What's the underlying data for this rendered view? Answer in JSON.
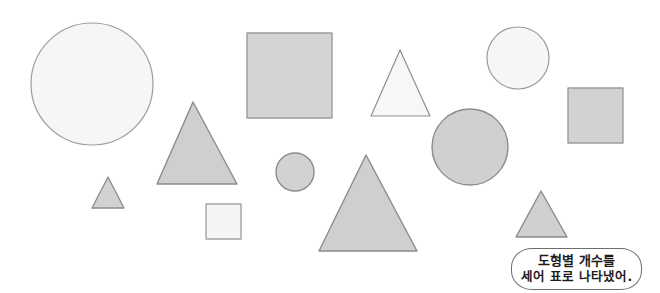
{
  "page": {
    "background_color": "#ffffff",
    "width": 660,
    "height": 293
  },
  "palette": {
    "shape_fill_gray": "#d2d2d2",
    "shape_fill_light": "#f2f2f2",
    "shape_stroke_gray": "#8c8c8c",
    "shape_stroke_light": "#9a9a9a",
    "bubble_border": "#6e6e6e",
    "bubble_background": "#ffffff",
    "bubble_text": "#1b1b1b"
  },
  "shapes": [
    {
      "id": "circle-large-white",
      "kind": "circle",
      "label": "큰 흰색 원",
      "cx": 92,
      "cy": 84,
      "r": 61,
      "fill": "#f6f6f6",
      "stroke": "#9a9a9a",
      "stroke_width": 1.2
    },
    {
      "id": "square-large-gray",
      "kind": "square",
      "label": "큰 회색 정사각형",
      "x": 247,
      "y": 33,
      "size": 85,
      "fill": "#d4d4d4",
      "stroke": "#9c9c9c",
      "stroke_width": 1.4
    },
    {
      "id": "triangle-top-white",
      "kind": "triangle",
      "label": "위쪽 흰색 삼각형",
      "apex_x": 400,
      "apex_y": 50,
      "base_left_x": 371,
      "base_right_x": 430,
      "base_y": 116,
      "fill": "#f7f7f7",
      "stroke": "#8f8f8f",
      "stroke_width": 1.2
    },
    {
      "id": "circle-topright-white",
      "kind": "circle",
      "label": "오른쪽 위 흰색 원",
      "cx": 518,
      "cy": 58,
      "r": 31,
      "fill": "#f6f6f6",
      "stroke": "#9a9a9a",
      "stroke_width": 1.2
    },
    {
      "id": "square-right-gray",
      "kind": "square",
      "label": "오른쪽 회색 정사각형",
      "x": 568,
      "y": 88,
      "size": 55,
      "fill": "#d2d2d2",
      "stroke": "#9c9c9c",
      "stroke_width": 1.4
    },
    {
      "id": "triangle-left-gray",
      "kind": "triangle",
      "label": "왼쪽 큰 회색 삼각형",
      "apex_x": 193,
      "apex_y": 102,
      "base_left_x": 157,
      "base_right_x": 237,
      "base_y": 184,
      "fill": "#cfcfcf",
      "stroke": "#8c8c8c",
      "stroke_width": 1.4
    },
    {
      "id": "circle-mid-gray",
      "kind": "circle",
      "label": "가운데 회색 큰 원",
      "cx": 470,
      "cy": 147,
      "r": 38,
      "fill": "#d0d0d0",
      "stroke": "#8c8c8c",
      "stroke_width": 1.4
    },
    {
      "id": "circle-small-gray",
      "kind": "circle",
      "label": "작은 회색 원",
      "cx": 295,
      "cy": 172,
      "r": 19,
      "fill": "#d2d2d2",
      "stroke": "#8c8c8c",
      "stroke_width": 1.4
    },
    {
      "id": "triangle-small-left-gray",
      "kind": "triangle",
      "label": "왼쪽 작은 회색 삼각형",
      "apex_x": 108,
      "apex_y": 177,
      "base_left_x": 92,
      "base_right_x": 124,
      "base_y": 208,
      "fill": "#d2d2d2",
      "stroke": "#8c8c8c",
      "stroke_width": 1.3
    },
    {
      "id": "triangle-center-gray",
      "kind": "triangle",
      "label": "가운데 큰 회색 삼각형",
      "apex_x": 366,
      "apex_y": 155,
      "base_left_x": 319,
      "base_right_x": 417,
      "base_y": 251,
      "fill": "#cfcfcf",
      "stroke": "#8c8c8c",
      "stroke_width": 1.4
    },
    {
      "id": "triangle-small-right-gray",
      "kind": "triangle",
      "label": "오른쪽 작은 회색 삼각형",
      "apex_x": 541,
      "apex_y": 191,
      "base_left_x": 516,
      "base_right_x": 567,
      "base_y": 237,
      "fill": "#d0d0d0",
      "stroke": "#8c8c8c",
      "stroke_width": 1.4
    },
    {
      "id": "square-small-white",
      "kind": "square",
      "label": "작은 흰색 정사각형",
      "x": 206,
      "y": 204,
      "size": 35,
      "fill": "#f4f4f4",
      "stroke": "#a3a3a3",
      "stroke_width": 1.4
    }
  ],
  "counts": {
    "circles": 4,
    "squares": 3,
    "triangles": 5,
    "total": 12
  },
  "speech_bubble": {
    "line_1": "도형별 개수를",
    "line_2": "세어 표로 나타냈어."
  }
}
